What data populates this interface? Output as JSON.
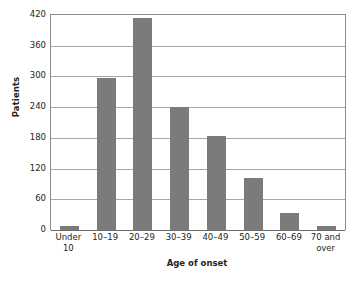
{
  "chart_data": {
    "type": "bar",
    "title": "",
    "xlabel": "Age of onset",
    "ylabel": "Patients",
    "categories": [
      "Under 10",
      "10–19",
      "20–29",
      "30–39",
      "40–49",
      "50–59",
      "60–69",
      "70 and over"
    ],
    "category_lines": [
      [
        "Under",
        "10"
      ],
      [
        "10–19",
        ""
      ],
      [
        "20–29",
        ""
      ],
      [
        "30–39",
        ""
      ],
      [
        "40–49",
        ""
      ],
      [
        "50–59",
        ""
      ],
      [
        "60–69",
        ""
      ],
      [
        "70 and",
        "over"
      ]
    ],
    "values": [
      7,
      296,
      415,
      240,
      183,
      101,
      33,
      8
    ],
    "ylim": [
      0,
      420
    ],
    "yticks": [
      0,
      60,
      120,
      180,
      240,
      300,
      360,
      420
    ],
    "ytick_labels": [
      "0",
      "60",
      "120",
      "180",
      "240",
      "300",
      "360",
      "420"
    ],
    "grid": true,
    "legend": false,
    "bar_color": "#7b7b7b",
    "gridline_color": "#a6a6a6",
    "axis_color": "#8c8c8c",
    "background": "#ffffff"
  }
}
